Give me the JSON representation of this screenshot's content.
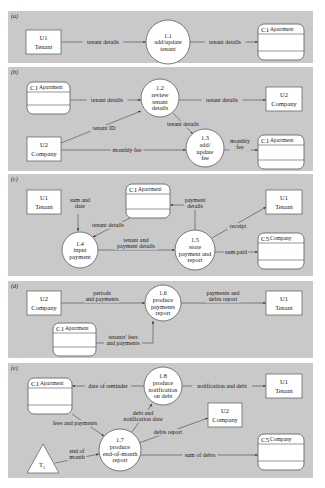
{
  "diagram": {
    "colors": {
      "panel_bg": "#c9c9c9",
      "shape_fill": "#ffffff",
      "stroke": "#6a6a6a",
      "text": "#222222"
    },
    "panels": [
      {
        "tag": "(a)",
        "x": 8,
        "y": 11,
        "w": 305,
        "h": 52,
        "entities": [
          {
            "id": "e_a_u1",
            "line1": "U1",
            "line2": "Tenant",
            "x": 26,
            "y": 30,
            "w": 35,
            "h": 24
          }
        ],
        "processes": [
          {
            "id": "p11",
            "lines": [
              "1.1",
              "add/update",
              "tenant"
            ],
            "cx": 168,
            "cy": 42,
            "r": 22
          }
        ],
        "stores": [
          {
            "id": "s_a_c1",
            "num": "C1",
            "name": "Apartment",
            "x": 258,
            "y": 24,
            "w": 46,
            "h": 36
          }
        ],
        "flows": [
          {
            "points": [
              [
                61,
                42
              ],
              [
                146,
                42
              ]
            ],
            "label": "tenant details",
            "lx": 103,
            "ly": 44
          },
          {
            "points": [
              [
                190,
                42
              ],
              [
                258,
                42
              ]
            ],
            "label": "tenant details",
            "lx": 225,
            "ly": 44
          }
        ]
      },
      {
        "tag": "(b)",
        "x": 8,
        "y": 67,
        "w": 305,
        "h": 104,
        "entities": [
          {
            "id": "e_b_u2a",
            "line1": "U2",
            "line2": "Company",
            "x": 266,
            "y": 87,
            "w": 36,
            "h": 24
          },
          {
            "id": "e_b_u2b",
            "line1": "U2",
            "line2": "Company",
            "x": 27,
            "y": 137,
            "w": 34,
            "h": 24
          }
        ],
        "processes": [
          {
            "id": "p12",
            "lines": [
              "1.2",
              "review",
              "tenant",
              "details"
            ],
            "cx": 160,
            "cy": 98,
            "r": 19
          },
          {
            "id": "p13",
            "lines": [
              "1.3",
              "add/",
              "update",
              "fee"
            ],
            "cx": 205,
            "cy": 148,
            "r": 19
          }
        ],
        "stores": [
          {
            "id": "s_b_c1a",
            "num": "C1",
            "name": "Apartment",
            "x": 27,
            "y": 82,
            "w": 43,
            "h": 32
          },
          {
            "id": "s_b_c1b",
            "num": "C1",
            "name": "Apartment",
            "x": 258,
            "y": 135,
            "w": 46,
            "h": 34
          }
        ],
        "flows": [
          {
            "points": [
              [
                70,
                100
              ],
              [
                141,
                100
              ]
            ],
            "label": "tenant details",
            "lx": 107,
            "ly": 102
          },
          {
            "points": [
              [
                179,
                100
              ],
              [
                266,
                100
              ]
            ],
            "label": "tenant details",
            "lx": 222,
            "ly": 102
          },
          {
            "points": [
              [
                61,
                143
              ],
              [
                141,
                111
              ]
            ],
            "label": "tenant ID",
            "lx": 104,
            "ly": 130
          },
          {
            "points": [
              [
                173,
                113
              ],
              [
                193,
                134
              ]
            ],
            "label": "tenant details",
            "lx": 183,
            "ly": 126
          },
          {
            "points": [
              [
                61,
                150
              ],
              [
                186,
                150
              ]
            ],
            "label": "monthly fee",
            "lx": 127,
            "ly": 152
          },
          {
            "points": [
              [
                224,
                150
              ],
              [
                258,
                150
              ]
            ],
            "label": "monthly\nfee",
            "lx": 240,
            "ly": 146
          }
        ]
      },
      {
        "tag": "(c)",
        "x": 8,
        "y": 174,
        "w": 305,
        "h": 102,
        "entities": [
          {
            "id": "e_c_u1a",
            "line1": "U1",
            "line2": "Tenant",
            "x": 27,
            "y": 190,
            "w": 34,
            "h": 24
          },
          {
            "id": "e_c_u1b",
            "line1": "U1",
            "line2": "Tenant",
            "x": 266,
            "y": 190,
            "w": 36,
            "h": 24
          }
        ],
        "processes": [
          {
            "id": "p14",
            "lines": [
              "1.4",
              "input",
              "payment"
            ],
            "cx": 80,
            "cy": 250,
            "r": 18
          },
          {
            "id": "p15",
            "lines": [
              "1.5",
              "store",
              "payment and",
              "report"
            ],
            "cx": 195,
            "cy": 250,
            "r": 20
          }
        ],
        "stores": [
          {
            "id": "s_c_c1",
            "num": "C1",
            "name": "Apartment",
            "x": 126,
            "y": 184,
            "w": 44,
            "h": 34
          },
          {
            "id": "s_c_c5",
            "num": "C5",
            "name": "Company",
            "x": 258,
            "y": 233,
            "w": 46,
            "h": 36
          }
        ],
        "flows": [
          {
            "points": [
              [
                78,
                214
              ],
              [
                78,
                231
              ]
            ],
            "label": "sum and\ndate",
            "lx": 80,
            "ly": 205
          },
          {
            "points": [
              [
                130,
                218
              ],
              [
                93,
                237
              ]
            ],
            "label": "tenant details",
            "lx": 108,
            "ly": 227
          },
          {
            "points": [
              [
                98,
                250
              ],
              [
                175,
                250
              ]
            ],
            "label": "tenant and\npayment details",
            "lx": 136,
            "ly": 245
          },
          {
            "points": [
              [
                195,
                230
              ],
              [
                195,
                205
              ],
              [
                170,
                205
              ]
            ],
            "label": "payment\ndetails",
            "lx": 195,
            "ly": 205
          },
          {
            "points": [
              [
                212,
                238
              ],
              [
                266,
                207
              ]
            ],
            "label": "receipt",
            "lx": 238,
            "ly": 228
          },
          {
            "points": [
              [
                215,
                252
              ],
              [
                258,
                252
              ]
            ],
            "label": "sum paid",
            "lx": 236,
            "ly": 254
          }
        ]
      },
      {
        "tag": "(d)",
        "x": 8,
        "y": 281,
        "w": 305,
        "h": 77,
        "entities": [
          {
            "id": "e_d_u2",
            "line1": "U2",
            "line2": "Company",
            "x": 27,
            "y": 291,
            "w": 34,
            "h": 24
          },
          {
            "id": "e_d_u1",
            "line1": "U1",
            "line2": "Tenant",
            "x": 266,
            "y": 291,
            "w": 36,
            "h": 24
          }
        ],
        "processes": [
          {
            "id": "p16",
            "lines": [
              "1.6",
              "produce",
              "payments",
              "report"
            ],
            "cx": 163,
            "cy": 303,
            "r": 18
          }
        ],
        "stores": [
          {
            "id": "s_d_c1",
            "num": "C1",
            "name": "Apartment",
            "x": 53,
            "y": 323,
            "w": 43,
            "h": 33
          }
        ],
        "flows": [
          {
            "points": [
              [
                61,
                303
              ],
              [
                145,
                303
              ]
            ],
            "label": "periods\nand payments",
            "lx": 102,
            "ly": 298
          },
          {
            "points": [
              [
                181,
                303
              ],
              [
                266,
                303
              ]
            ],
            "label": "payments and\ndebts report",
            "lx": 223,
            "ly": 298
          },
          {
            "points": [
              [
                96,
                343
              ],
              [
                153,
                343
              ],
              [
                153,
                321
              ]
            ],
            "label": "tenants' fees\nand payments",
            "lx": 123,
            "ly": 342
          }
        ]
      },
      {
        "tag": "(e)",
        "x": 8,
        "y": 363,
        "w": 305,
        "h": 115,
        "entities": [
          {
            "id": "e_e_u1",
            "line1": "U1",
            "line2": "Tenant",
            "x": 266,
            "y": 374,
            "w": 36,
            "h": 24
          },
          {
            "id": "e_e_u2",
            "line1": "U2",
            "line2": "Company",
            "x": 208,
            "y": 403,
            "w": 34,
            "h": 24
          }
        ],
        "processes": [
          {
            "id": "p18",
            "lines": [
              "1.8",
              "produce",
              "notification",
              "on debt"
            ],
            "cx": 163,
            "cy": 386,
            "r": 19
          },
          {
            "id": "p17",
            "lines": [
              "1.7",
              "produce",
              "end-of-month",
              "report"
            ],
            "cx": 120,
            "cy": 450,
            "r": 21
          }
        ],
        "stores": [
          {
            "id": "s_e_c1",
            "num": "C1",
            "name": "Apartment",
            "x": 28,
            "y": 378,
            "w": 44,
            "h": 36
          },
          {
            "id": "s_e_c5",
            "num": "C5",
            "name": "Company",
            "x": 258,
            "y": 434,
            "w": 46,
            "h": 36
          }
        ],
        "terminators": [
          {
            "id": "t1",
            "label": "T",
            "sub": "1",
            "x1": 27,
            "y1": 473,
            "x2": 59,
            "y2": 473,
            "x3": 43,
            "y3": 444
          }
        ],
        "flows": [
          {
            "points": [
              [
                144,
                386
              ],
              [
                72,
                386
              ]
            ],
            "label": "date of reminder",
            "lx": 108,
            "ly": 388
          },
          {
            "points": [
              [
                182,
                386
              ],
              [
                266,
                386
              ]
            ],
            "label": "notification and debt",
            "lx": 222,
            "ly": 388
          },
          {
            "points": [
              [
                72,
                414
              ],
              [
                104,
                436
              ]
            ],
            "label": "fees and payments",
            "lx": 75,
            "ly": 425
          },
          {
            "points": [
              [
                132,
                432
              ],
              [
                152,
                404
              ]
            ],
            "label": "debt and\nnotification date",
            "lx": 143,
            "ly": 418
          },
          {
            "points": [
              [
                139,
                443
              ],
              [
                208,
                418
              ]
            ],
            "label": "debts report",
            "lx": 168,
            "ly": 434
          },
          {
            "points": [
              [
                141,
                455
              ],
              [
                258,
                455
              ]
            ],
            "label": "sum of debts",
            "lx": 200,
            "ly": 457
          },
          {
            "points": [
              [
                55,
                463
              ],
              [
                99,
                454
              ]
            ],
            "label": "end of\nmonth",
            "lx": 77,
            "ly": 456
          }
        ]
      }
    ]
  }
}
